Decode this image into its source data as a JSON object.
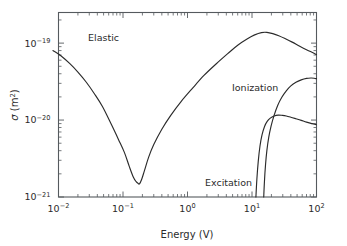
{
  "chart_data": {
    "type": "line",
    "title": "",
    "xlabel": "Energy (V)",
    "ylabel": "σ (m²)",
    "xscale": "log",
    "yscale": "log",
    "xlim": [
      0.01,
      100
    ],
    "ylim": [
      1e-21,
      2.5e-19
    ],
    "grid": false,
    "legend": "inline-annotations",
    "xtick_labels": [
      "10⁻²",
      "10⁻¹",
      "10⁰",
      "10¹",
      "10²"
    ],
    "xtick_values": [
      0.01,
      0.1,
      1,
      10,
      100
    ],
    "ytick_labels": [
      "10⁻¹⁹",
      "10⁻²⁰",
      "10⁻²¹"
    ],
    "ytick_values": [
      1e-19,
      1e-20,
      1e-21
    ],
    "series": [
      {
        "name": "Elastic",
        "label_x": 0.035,
        "label_y": 7e-20,
        "x": [
          0.0082,
          0.011,
          0.015,
          0.02,
          0.027,
          0.036,
          0.048,
          0.065,
          0.085,
          0.105,
          0.125,
          0.145,
          0.16,
          0.172,
          0.18,
          0.195,
          0.215,
          0.25,
          0.3,
          0.4,
          0.55,
          0.8,
          1.2,
          1.8,
          2.8,
          4.2,
          6.0,
          8.5,
          11.0,
          14.0,
          17.0,
          21.0,
          26.0,
          33.0,
          42.0,
          55.0,
          70.0,
          85.0,
          100.0
        ],
        "y": [
          8e-20,
          6.8e-20,
          5.4e-20,
          4.2e-20,
          3.1e-20,
          2.2e-20,
          1.5e-20,
          9e-21,
          5.6e-21,
          3.8e-21,
          2.5e-21,
          1.8e-21,
          1.58e-21,
          1.5e-21,
          1.48e-21,
          1.7e-21,
          2.2e-21,
          3.3e-21,
          4.8e-21,
          7.6e-21,
          1.15e-20,
          1.75e-20,
          2.6e-20,
          3.8e-20,
          5.4e-20,
          7.3e-20,
          9.4e-20,
          1.14e-19,
          1.28e-19,
          1.37e-19,
          1.38e-19,
          1.33e-19,
          1.25e-19,
          1.14e-19,
          1.03e-19,
          9.1e-20,
          8.2e-20,
          7.6e-20,
          7.1e-20
        ]
      },
      {
        "name": "Ionization",
        "label_x": 14.0,
        "label_y": 2.3e-20,
        "x": [
          15.2,
          15.6,
          16.2,
          17.0,
          18.2,
          19.8,
          22.0,
          25.0,
          29.0,
          34.0,
          40.0,
          48.0,
          58.0,
          70.0,
          82.0,
          92.0,
          100.0
        ],
        "y": [
          1e-21,
          1.6e-21,
          2.6e-21,
          4e-21,
          6e-21,
          8.4e-21,
          1.15e-20,
          1.55e-20,
          1.98e-20,
          2.4e-20,
          2.78e-20,
          3.1e-20,
          3.33e-20,
          3.48e-20,
          3.52e-20,
          3.5e-20,
          3.45e-20
        ]
      },
      {
        "name": "Excitation",
        "label_x": 1.9,
        "label_y": 1.8e-21,
        "x": [
          11.5,
          11.9,
          12.5,
          13.3,
          14.3,
          15.6,
          17.2,
          19.2,
          22.0,
          25.5,
          29.5,
          34.0,
          40.0,
          48.0,
          58.0,
          70.0,
          85.0,
          100.0
        ],
        "y": [
          1e-21,
          1.7e-21,
          2.9e-21,
          4.6e-21,
          6.4e-21,
          8.2e-21,
          9.6e-21,
          1.06e-20,
          1.13e-20,
          1.16e-20,
          1.15e-20,
          1.13e-20,
          1.09e-20,
          1.04e-20,
          9.9e-21,
          9.4e-21,
          9e-21,
          8.7e-21
        ]
      }
    ]
  },
  "axes": {
    "x_title": "Energy (V)",
    "y_title_symbol": "σ",
    "y_title_unit_base": " (m",
    "y_title_unit_sup": "2",
    "y_title_unit_close": ")"
  },
  "annotations": {
    "elastic": "Elastic",
    "ionization": "Ionization",
    "excitation": "Excitation"
  },
  "xticks": [
    {
      "base": "10",
      "exp": "−2"
    },
    {
      "base": "10",
      "exp": "−1"
    },
    {
      "base": "10",
      "exp": "0"
    },
    {
      "base": "10",
      "exp": "1"
    },
    {
      "base": "10",
      "exp": "2"
    }
  ],
  "yticks": [
    {
      "base": "10",
      "exp": "−19"
    },
    {
      "base": "10",
      "exp": "−20"
    },
    {
      "base": "10",
      "exp": "−21"
    }
  ],
  "colors": {
    "curve": "#2b2b2b",
    "axis": "#555a5e",
    "background": "#ffffff",
    "text": "#2b2b2b"
  }
}
